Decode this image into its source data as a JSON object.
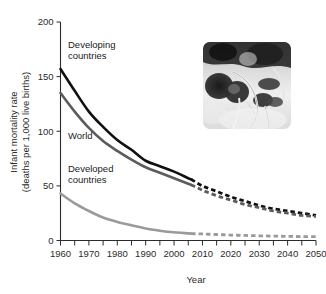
{
  "chart_data": {
    "type": "line",
    "title": "",
    "xlabel": "Year",
    "ylabel": "Infant mortality rate\n(deaths per 1,000 live births)",
    "ylabel_line1": "Infant mortality rate",
    "ylabel_line2": "(deaths per 1,000 live births)",
    "xlim": [
      1960,
      2050
    ],
    "ylim": [
      0,
      200
    ],
    "grid": false,
    "legend_position": "inline-annotations",
    "x_ticks": [
      1960,
      1970,
      1980,
      1990,
      2000,
      2010,
      2020,
      2030,
      2040,
      2050
    ],
    "x_tick_labels": [
      "1960",
      "1970",
      "1980",
      "1990",
      "2000",
      "2010",
      "2020",
      "2030",
      "2040",
      "2050"
    ],
    "x_minor_ticks": [
      1965,
      1975,
      1985,
      1995,
      2005,
      2015,
      2025,
      2035,
      2045
    ],
    "y_ticks": [
      0,
      50,
      100,
      150,
      200
    ],
    "y_tick_labels": [
      "0",
      "50",
      "100",
      "150",
      "200"
    ],
    "projection_start_year": 2006,
    "series": [
      {
        "name": "Developing countries",
        "color": "#111111",
        "label_lines": [
          "Developing",
          "countries"
        ],
        "x": [
          1960,
          1965,
          1970,
          1975,
          1980,
          1985,
          1990,
          1995,
          2000,
          2005,
          2006
        ],
        "values": [
          157,
          137,
          118,
          104,
          92,
          83,
          73,
          68,
          63,
          57,
          56
        ],
        "projection_x": [
          2006,
          2010,
          2015,
          2020,
          2025,
          2030,
          2035,
          2040,
          2045,
          2050
        ],
        "projection_values": [
          56,
          50,
          45,
          40,
          36,
          32,
          29,
          27,
          25,
          23
        ]
      },
      {
        "name": "World",
        "color": "#5c5c5c",
        "label_lines": [
          "World"
        ],
        "x": [
          1960,
          1965,
          1970,
          1975,
          1980,
          1985,
          1990,
          1995,
          2000,
          2005,
          2006
        ],
        "values": [
          135,
          118,
          103,
          91,
          82,
          74,
          67,
          62,
          57,
          52,
          51
        ],
        "projection_x": [
          2006,
          2010,
          2015,
          2020,
          2025,
          2030,
          2035,
          2040,
          2045,
          2050
        ],
        "projection_values": [
          51,
          46,
          41,
          37,
          33,
          30,
          27,
          25,
          23,
          22
        ]
      },
      {
        "name": "Developed countries",
        "color": "#9a9a9a",
        "label_lines": [
          "Developed",
          "countries"
        ],
        "x": [
          1960,
          1965,
          1970,
          1975,
          1980,
          1985,
          1990,
          1995,
          2000,
          2005,
          2006
        ],
        "values": [
          43,
          34,
          27,
          21,
          17,
          14,
          11,
          9,
          7.5,
          6.5,
          6.3
        ],
        "projection_x": [
          2006,
          2010,
          2015,
          2020,
          2025,
          2030,
          2035,
          2040,
          2045,
          2050
        ],
        "projection_values": [
          6.3,
          6,
          5.5,
          5,
          4.6,
          4.3,
          4,
          3.8,
          3.6,
          3.5
        ]
      }
    ],
    "annotations": [
      {
        "text": "Developing countries",
        "x_px": 68,
        "y_px": 48
      },
      {
        "text": "World",
        "x_px": 68,
        "y_px": 139
      },
      {
        "text": "Developed countries",
        "x_px": 68,
        "y_px": 172
      }
    ]
  },
  "inset": {
    "name": "infant-photo",
    "alt": "Grayscale photo of an infant with medical tubes",
    "x": 203,
    "y": 42,
    "width": 88,
    "height": 87
  },
  "colors": {
    "developing": "#111111",
    "world": "#5c5c5c",
    "developed": "#9a9a9a",
    "axis": "#2b2b2b",
    "background": "#ffffff"
  }
}
